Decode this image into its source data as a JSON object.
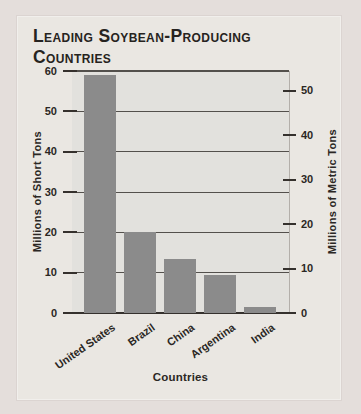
{
  "figure": {
    "title_line1": "Leading Soybean-Producing",
    "title_line2": "Countries"
  },
  "chart_data": {
    "type": "bar",
    "title": "Leading Soybean-Producing Countries",
    "categories": [
      "United States",
      "Brazil",
      "China",
      "Argentina",
      "India"
    ],
    "values": [
      59,
      20,
      13.5,
      9.5,
      1.5
    ],
    "values_unit": "millions of short tons",
    "xlabel": "Countries",
    "ylabel_left": "Millions of Short Tons",
    "ylabel_right": "Millions of Metric Tons",
    "left_axis": {
      "ticks": [
        0,
        10,
        20,
        30,
        40,
        50,
        60
      ],
      "range": [
        0,
        60
      ]
    },
    "right_axis": {
      "ticks": [
        0,
        10,
        20,
        30,
        40,
        50
      ],
      "conversion_short_per_metric": 1.10231
    },
    "grid": true,
    "legend": "none",
    "bar_color": "#8b8b8b",
    "plot_background": "#e2e1dd",
    "gridline_color": "#53504c",
    "axis_line_color": "#35312d",
    "text_color": "#2b2724"
  }
}
